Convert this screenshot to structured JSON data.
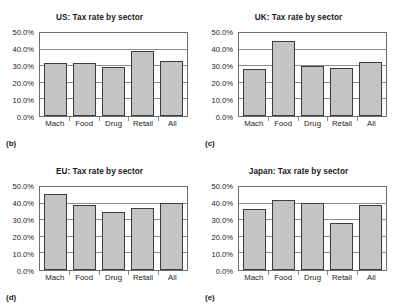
{
  "figure": {
    "axis": {
      "ylim": [
        0,
        50
      ],
      "ytick_step": 10,
      "ytick_labels": [
        "0.0%",
        "10.0%",
        "20.0%",
        "30.0%",
        "40.0%",
        "50.0%"
      ],
      "grid": true
    }
  },
  "chart_data": [
    {
      "type": "bar",
      "panel_letter": "(b)",
      "title": "US: Tax rate by sector",
      "categories": [
        "Mach",
        "Food",
        "Drug",
        "Retail",
        "All"
      ],
      "values": [
        31.8,
        32.0,
        29.5,
        39.4,
        33.2
      ],
      "xlabel": "",
      "ylabel": "",
      "ylim": [
        0,
        50
      ],
      "ytick_labels": [
        "0.0%",
        "10.0%",
        "20.0%",
        "30.0%",
        "40.0%",
        "50.0%"
      ]
    },
    {
      "type": "bar",
      "panel_letter": "(c)",
      "title": "UK: Tax rate by sector",
      "categories": [
        "Mach",
        "Food",
        "Drug",
        "Retail",
        "All"
      ],
      "values": [
        28.3,
        44.9,
        30.3,
        28.7,
        32.3
      ],
      "xlabel": "",
      "ylabel": "",
      "ylim": [
        0,
        50
      ],
      "ytick_labels": [
        "0.0%",
        "10.0%",
        "20.0%",
        "30.0%",
        "40.0%",
        "50.0%"
      ]
    },
    {
      "type": "bar",
      "panel_letter": "(d)",
      "title": "EU: Tax rate by sector",
      "categories": [
        "Mach",
        "Food",
        "Drug",
        "Retail",
        "All"
      ],
      "values": [
        45.9,
        39.4,
        35.1,
        37.4,
        40.3
      ],
      "xlabel": "",
      "ylabel": "",
      "ylim": [
        0,
        50
      ],
      "ytick_labels": [
        "0.0%",
        "10.0%",
        "20.0%",
        "30.0%",
        "40.0%",
        "50.0%"
      ]
    },
    {
      "type": "bar",
      "panel_letter": "(e)",
      "title": "Japan: Tax rate by sector",
      "categories": [
        "Mach",
        "Food",
        "Drug",
        "Retail",
        "All"
      ],
      "values": [
        36.5,
        42.0,
        40.2,
        28.3,
        39.1
      ],
      "xlabel": "",
      "ylabel": "",
      "ylim": [
        0,
        50
      ],
      "ytick_labels": [
        "0.0%",
        "10.0%",
        "20.0%",
        "30.0%",
        "40.0%",
        "50.0%"
      ]
    }
  ],
  "colors": {
    "bar_fill": "#c4c4c4",
    "bar_border": "#3c3c3c",
    "gridline": "#8c8c8c",
    "frame": "#6e6e6e",
    "text": "#1a1a1a",
    "background": "#ffffff"
  }
}
